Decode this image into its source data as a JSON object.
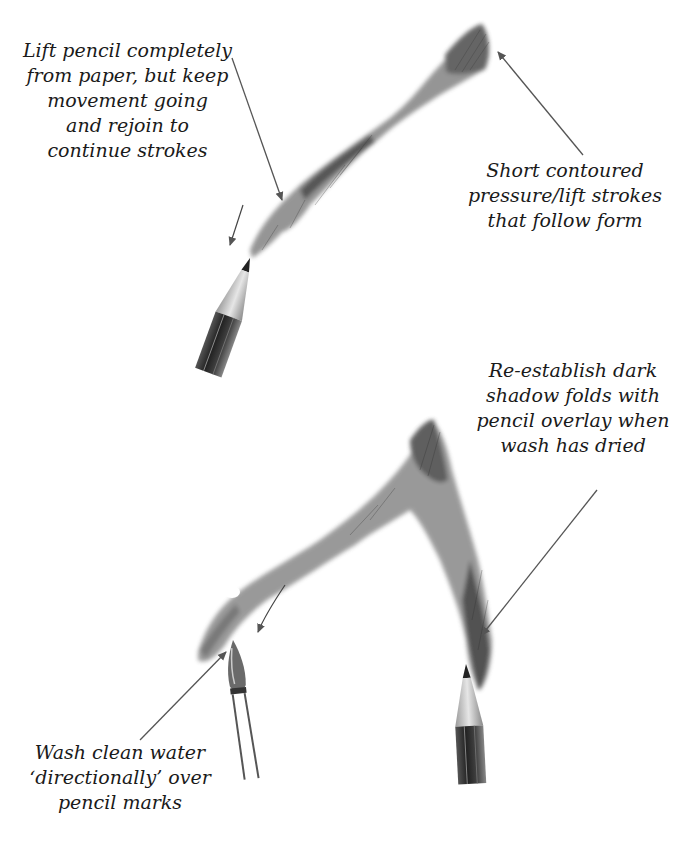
{
  "colors": {
    "background": "#ffffff",
    "text": "#1a1a1a",
    "arrow": "#555555",
    "graphite_dark": "#2a2a2a",
    "graphite_mid": "#777777",
    "graphite_light": "#b5b5b5"
  },
  "annotations": {
    "lift_pencil": {
      "lines": [
        "Lift pencil completely",
        "from paper, but keep",
        "movement going",
        "and rejoin to",
        "continue strokes"
      ]
    },
    "short_contoured": {
      "lines": [
        "Short contoured",
        "pressure/lift strokes",
        "that follow form"
      ]
    },
    "re_establish": {
      "lines": [
        "Re-establish dark",
        "shadow folds with",
        "pencil overlay when",
        "wash has dried"
      ]
    },
    "wash_clean": {
      "lines": [
        "Wash clean water",
        "‘directionally’ over",
        "pencil marks"
      ]
    }
  },
  "illustrations": {
    "top": "pencil stroke contour with pencil",
    "bottom": "washed graphite fold with brush and pencil"
  }
}
